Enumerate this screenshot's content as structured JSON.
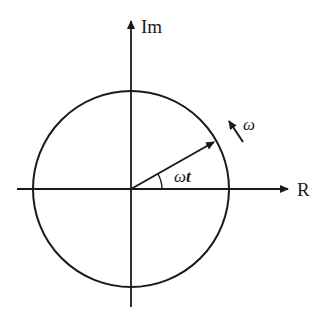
{
  "diagram": {
    "axes": {
      "imaginary_label": "Im",
      "real_label": "R"
    },
    "phasor": {
      "angle_label_omega": "ω",
      "angle_label_t": "t",
      "rotation_label": "ω"
    },
    "colors": {
      "stroke": "#1a1a1a",
      "background": "#ffffff"
    }
  }
}
